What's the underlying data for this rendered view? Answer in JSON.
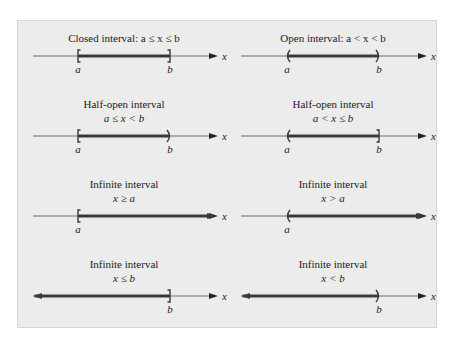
{
  "figure": {
    "axis_variable": "x",
    "colors": {
      "panel_background": "#ececec",
      "axis_line": "#6a6a6a",
      "interval_bar": "#3a3a3a",
      "text": "#1a1a1a"
    },
    "intervals": [
      {
        "id": "closed",
        "title": "Closed interval: a ≤ x ≤ b",
        "notation": "",
        "left_end": {
          "type": "closed",
          "label": "a"
        },
        "right_end": {
          "type": "closed",
          "label": "b"
        }
      },
      {
        "id": "open",
        "title": "Open interval: a < x < b",
        "notation": "",
        "left_end": {
          "type": "open",
          "label": "a"
        },
        "right_end": {
          "type": "open",
          "label": "b"
        }
      },
      {
        "id": "half-open-right",
        "title": "Half-open interval",
        "notation": "a ≤ x < b",
        "left_end": {
          "type": "closed",
          "label": "a"
        },
        "right_end": {
          "type": "open",
          "label": "b"
        }
      },
      {
        "id": "half-open-left",
        "title": "Half-open interval",
        "notation": "a < x ≤ b",
        "left_end": {
          "type": "open",
          "label": "a"
        },
        "right_end": {
          "type": "closed",
          "label": "b"
        }
      },
      {
        "id": "infinite-ge",
        "title": "Infinite interval",
        "notation": "x ≥ a",
        "left_end": {
          "type": "closed",
          "label": "a"
        },
        "right_end": {
          "type": "infinite",
          "label": ""
        }
      },
      {
        "id": "infinite-gt",
        "title": "Infinite interval",
        "notation": "x > a",
        "left_end": {
          "type": "open",
          "label": "a"
        },
        "right_end": {
          "type": "infinite",
          "label": ""
        }
      },
      {
        "id": "infinite-le",
        "title": "Infinite interval",
        "notation": "x ≤ b",
        "left_end": {
          "type": "infinite",
          "label": ""
        },
        "right_end": {
          "type": "closed",
          "label": "b"
        }
      },
      {
        "id": "infinite-lt",
        "title": "Infinite interval",
        "notation": "x < b",
        "left_end": {
          "type": "infinite",
          "label": ""
        },
        "right_end": {
          "type": "open",
          "label": "b"
        }
      }
    ]
  }
}
